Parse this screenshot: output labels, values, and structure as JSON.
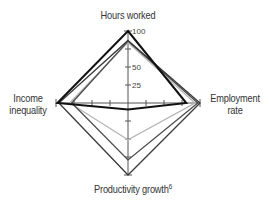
{
  "chart_data": {
    "type": "radar",
    "title": "",
    "axes": [
      "Hours worked",
      "Employment rate",
      "Productivity growth",
      "Income inequality"
    ],
    "axis_footnote": {
      "Productivity growth": "6"
    },
    "range": [
      0,
      100
    ],
    "ticks": [
      25,
      50,
      75,
      100
    ],
    "tick_labels_visible": [
      "25",
      "50",
      "100"
    ],
    "grid": false,
    "legend": null,
    "series": [
      {
        "name": "Series 1",
        "color": "#111111",
        "width": 2,
        "values": [
          100,
          81,
          9,
          98
        ]
      },
      {
        "name": "Series 2",
        "color": "#3a3a3a",
        "width": 1.3,
        "values": [
          87,
          100,
          100,
          96
        ]
      },
      {
        "name": "Series 3",
        "color": "#4a4a4a",
        "width": 1.3,
        "values": [
          86,
          97,
          79,
          78
        ]
      },
      {
        "name": "Series 4",
        "color": "#b5b5b5",
        "width": 1.3,
        "values": [
          84,
          93,
          51,
          81
        ]
      }
    ]
  },
  "labels": {
    "hours": "Hours worked",
    "employment_1": "Employment",
    "employment_2": "rate",
    "income_1": "Income",
    "income_2": "inequality",
    "productivity": "Productivity growth",
    "productivity_note": "6",
    "tick_100": "100",
    "tick_50": "50",
    "tick_25": "25"
  }
}
